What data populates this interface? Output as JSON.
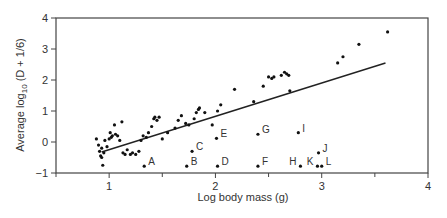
{
  "chart_data": {
    "type": "scatter",
    "title": "",
    "xlabel": "Log body mass (g)",
    "ylabel_main": "Average log",
    "ylabel_sub": "10",
    "ylabel_tail": " (D + 1/6)",
    "xlim": [
      0.5,
      4
    ],
    "ylim": [
      -1,
      4
    ],
    "xticks": [
      1,
      2,
      3,
      4
    ],
    "xminor": [
      0.5,
      1.5,
      2.5,
      3.5
    ],
    "yticks": [
      -1,
      0,
      1,
      2,
      3,
      4
    ],
    "ytick_labels": [
      "−1",
      "0",
      "1",
      "2",
      "3",
      "4"
    ],
    "grid": false,
    "regression_line": {
      "x": [
        0.93,
        3.6
      ],
      "y": [
        -0.32,
        2.55
      ]
    },
    "points": [
      [
        0.88,
        0.1
      ],
      [
        0.9,
        -0.1
      ],
      [
        0.91,
        -0.3
      ],
      [
        0.92,
        -0.45
      ],
      [
        0.93,
        -0.5
      ],
      [
        0.93,
        -0.2
      ],
      [
        0.94,
        -0.75
      ],
      [
        0.95,
        -0.35
      ],
      [
        0.96,
        0.05
      ],
      [
        0.98,
        -0.15
      ],
      [
        1.0,
        0.1
      ],
      [
        1.01,
        0.3
      ],
      [
        1.02,
        0.15
      ],
      [
        1.03,
        0.2
      ],
      [
        1.05,
        0.55
      ],
      [
        1.06,
        0.25
      ],
      [
        1.08,
        0.2
      ],
      [
        1.1,
        0.05
      ],
      [
        1.12,
        0.65
      ],
      [
        1.13,
        -0.35
      ],
      [
        1.15,
        -0.4
      ],
      [
        1.17,
        -0.25
      ],
      [
        1.2,
        -0.4
      ],
      [
        1.22,
        -0.35
      ],
      [
        1.25,
        -0.4
      ],
      [
        1.28,
        -0.3
      ],
      [
        1.3,
        0.05
      ],
      [
        1.32,
        0.2
      ],
      [
        1.35,
        0.15
      ],
      [
        1.37,
        0.3
      ],
      [
        1.4,
        0.5
      ],
      [
        1.42,
        0.75
      ],
      [
        1.43,
        0.8
      ],
      [
        1.45,
        0.7
      ],
      [
        1.47,
        0.8
      ],
      [
        1.5,
        0.1
      ],
      [
        1.55,
        0.3
      ],
      [
        1.62,
        0.45
      ],
      [
        1.65,
        0.7
      ],
      [
        1.68,
        0.85
      ],
      [
        1.72,
        0.6
      ],
      [
        1.75,
        0.55
      ],
      [
        1.8,
        0.75
      ],
      [
        1.82,
        0.95
      ],
      [
        1.84,
        1.05
      ],
      [
        1.85,
        1.1
      ],
      [
        1.9,
        0.95
      ],
      [
        1.97,
        0.55
      ],
      [
        2.02,
        1.0
      ],
      [
        2.05,
        1.2
      ],
      [
        2.18,
        1.7
      ],
      [
        2.36,
        1.3
      ],
      [
        2.45,
        1.8
      ],
      [
        2.5,
        2.1
      ],
      [
        2.53,
        2.05
      ],
      [
        2.55,
        2.1
      ],
      [
        2.62,
        2.15
      ],
      [
        2.65,
        2.25
      ],
      [
        2.67,
        2.2
      ],
      [
        2.69,
        2.15
      ],
      [
        2.7,
        1.65
      ],
      [
        3.15,
        2.55
      ],
      [
        3.2,
        2.75
      ],
      [
        3.35,
        3.15
      ],
      [
        3.62,
        3.55
      ]
    ],
    "labeled_points": [
      {
        "label": "A",
        "x": 1.33,
        "y": -0.78
      },
      {
        "label": "B",
        "x": 1.73,
        "y": -0.78
      },
      {
        "label": "C",
        "x": 1.78,
        "y": -0.3
      },
      {
        "label": "D",
        "x": 2.02,
        "y": -0.78
      },
      {
        "label": "E",
        "x": 2.01,
        "y": 0.12
      },
      {
        "label": "F",
        "x": 2.4,
        "y": -0.78
      },
      {
        "label": "G",
        "x": 2.4,
        "y": 0.25
      },
      {
        "label": "H",
        "x": 2.8,
        "y": -0.78,
        "label_side": "left"
      },
      {
        "label": "I",
        "x": 2.78,
        "y": 0.3
      },
      {
        "label": "J",
        "x": 2.97,
        "y": -0.35
      },
      {
        "label": "K",
        "x": 2.96,
        "y": -0.78,
        "label_side": "left"
      },
      {
        "label": "L",
        "x": 3.0,
        "y": -0.78
      }
    ]
  }
}
